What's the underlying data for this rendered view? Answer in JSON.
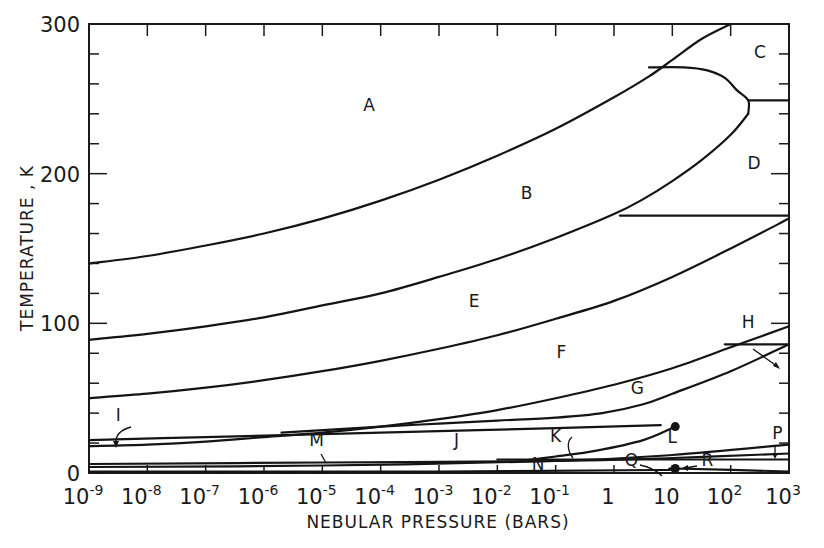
{
  "chart_data": {
    "type": "line",
    "title": "",
    "xlabel": "NEBULAR PRESSURE (BARS)",
    "ylabel": "TEMPERATURE , K",
    "xscale": "log",
    "xlim": [
      1e-09,
      1000.0
    ],
    "ylim": [
      0,
      300
    ],
    "grid": false,
    "legend": "none (regions labeled A–R directly on plot)",
    "x_tick_labels": [
      {
        "base": "10",
        "exp": "-9"
      },
      {
        "base": "10",
        "exp": "-8"
      },
      {
        "base": "10",
        "exp": "-7"
      },
      {
        "base": "10",
        "exp": "-6"
      },
      {
        "base": "10",
        "exp": "-5"
      },
      {
        "base": "10",
        "exp": "-4"
      },
      {
        "base": "10",
        "exp": "-3"
      },
      {
        "base": "10",
        "exp": "-2"
      },
      {
        "base": "10",
        "exp": "-1"
      },
      {
        "base": "1",
        "exp": ""
      },
      {
        "base": "10",
        "exp": ""
      },
      {
        "base": "10",
        "exp": "2"
      },
      {
        "base": "10",
        "exp": "3"
      }
    ],
    "y_tick_labels": [
      "0",
      "100",
      "200",
      "300"
    ],
    "series": [
      {
        "name": "A/B boundary",
        "x_log10P": [
          -9,
          -8,
          -7,
          -6,
          -5,
          -4,
          -3,
          -2,
          -1,
          0,
          0.6,
          1,
          1.5,
          2
        ],
        "T": [
          140,
          145,
          152,
          160,
          170,
          182,
          196,
          212,
          230,
          251,
          265,
          276,
          290,
          300
        ]
      },
      {
        "name": "B/E boundary",
        "x_log10P": [
          -9,
          -8,
          -7,
          -6,
          -5,
          -4,
          -3,
          -2,
          -1,
          0,
          0.5,
          1,
          1.5,
          2,
          2.3
        ],
        "T": [
          89,
          93,
          98,
          104,
          112,
          120,
          131,
          143,
          157,
          173,
          183,
          195,
          209,
          226,
          240
        ]
      },
      {
        "name": "C/D upper loop",
        "x_log10P": [
          0.6,
          1.2,
          1.6,
          1.9,
          2.1,
          2.3,
          2.3
        ],
        "T": [
          271,
          271,
          269,
          264,
          256,
          249,
          240
        ]
      },
      {
        "name": "C/D divider",
        "x_log10P": [
          2.3,
          3
        ],
        "T": [
          249,
          249
        ]
      },
      {
        "name": "D/E divider",
        "x_log10P": [
          0.1,
          3
        ],
        "T": [
          172,
          172
        ]
      },
      {
        "name": "E/F boundary",
        "x_log10P": [
          -9,
          -8,
          -7,
          -6,
          -5,
          -4,
          -3,
          -2,
          -1,
          0,
          1,
          2,
          3
        ],
        "T": [
          50,
          53,
          57,
          62,
          68,
          75,
          83,
          92,
          103,
          115,
          131,
          150,
          170
        ]
      },
      {
        "name": "F/G boundary",
        "x_log10P": [
          -9,
          -8,
          -7,
          -6,
          -5,
          -4,
          -3,
          -2,
          -1,
          0,
          1,
          2,
          3
        ],
        "T": [
          18,
          19,
          21,
          24,
          27,
          31,
          36,
          42,
          50,
          59,
          70,
          84,
          98
        ]
      },
      {
        "name": "H divider",
        "x_log10P": [
          1.9,
          3
        ],
        "T": [
          86,
          86
        ]
      },
      {
        "name": "G lower boundary",
        "x_log10P": [
          -5.7,
          -4,
          -3,
          -2,
          -1,
          -0.2,
          0.5,
          1,
          2,
          3
        ],
        "T": [
          27,
          31,
          33,
          35,
          37,
          40,
          46,
          53,
          68,
          86
        ]
      },
      {
        "name": "I/J boundary",
        "x_log10P": [
          -9,
          -7,
          -5,
          -3,
          -1,
          0.8
        ],
        "T": [
          22,
          24,
          26,
          28,
          30,
          32
        ]
      },
      {
        "name": "K/L curve",
        "x_log10P": [
          -1.6,
          -1,
          -0.3,
          0.5,
          1.05
        ],
        "T": [
          8,
          11,
          15,
          22,
          31
        ]
      },
      {
        "name": "M line",
        "x_log10P": [
          -9,
          -5,
          -1,
          1,
          3
        ],
        "T": [
          6,
          7,
          8,
          10,
          13
        ]
      },
      {
        "name": "N/P line",
        "x_log10P": [
          -9,
          -5,
          -1,
          1,
          3
        ],
        "T": [
          4,
          5,
          8,
          12,
          19
        ]
      },
      {
        "name": "P lower divider",
        "x_log10P": [
          -2,
          3
        ],
        "T": [
          9,
          9
        ]
      },
      {
        "name": "Q/R line",
        "x_log10P": [
          -9,
          -3,
          0.8,
          1.05,
          3
        ],
        "T": [
          1,
          1,
          2,
          3,
          1
        ]
      }
    ],
    "points": [
      {
        "label": "L endpoint",
        "x_log10P": 1.05,
        "T": 31
      },
      {
        "label": "R point",
        "x_log10P": 1.05,
        "T": 3
      }
    ],
    "region_labels": [
      {
        "label": "A",
        "x_log10P": -4.2,
        "T": 242
      },
      {
        "label": "B",
        "x_log10P": -1.5,
        "T": 183
      },
      {
        "label": "C",
        "x_log10P": 2.5,
        "T": 277
      },
      {
        "label": "D",
        "x_log10P": 2.4,
        "T": 203
      },
      {
        "label": "E",
        "x_log10P": -2.4,
        "T": 111
      },
      {
        "label": "F",
        "x_log10P": -0.9,
        "T": 77
      },
      {
        "label": "G",
        "x_log10P": 0.4,
        "T": 53
      },
      {
        "label": "H",
        "x_log10P": 2.3,
        "T": 97
      },
      {
        "label": "I",
        "x_log10P": -8.5,
        "T": 35
      },
      {
        "label": "J",
        "x_log10P": -2.7,
        "T": 18
      },
      {
        "label": "K",
        "x_log10P": -1.0,
        "T": 21
      },
      {
        "label": "L",
        "x_log10P": 1.0,
        "T": 20
      },
      {
        "label": "M",
        "x_log10P": -5.1,
        "T": 18
      },
      {
        "label": "N",
        "x_log10P": -1.3,
        "T": 2
      },
      {
        "label": "P",
        "x_log10P": 2.8,
        "T": 23
      },
      {
        "label": "Q",
        "x_log10P": 0.3,
        "T": 5
      },
      {
        "label": "R",
        "x_log10P": 1.6,
        "T": 5
      }
    ]
  }
}
